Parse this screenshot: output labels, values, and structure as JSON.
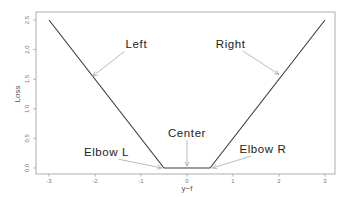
{
  "chart_data": {
    "type": "line",
    "title": "",
    "xlabel": "y−f",
    "ylabel": "Loss",
    "xlim": [
      -3.25,
      3.25
    ],
    "ylim": [
      -0.05,
      2.6
    ],
    "xticks": [
      -3,
      -2,
      -1,
      0,
      1,
      2,
      3
    ],
    "xtick_labels": [
      "-3",
      "-2",
      "-1",
      "0",
      "1",
      "2",
      "3"
    ],
    "yticks": [
      0.0,
      0.5,
      1.0,
      1.5,
      2.0,
      2.5
    ],
    "ytick_labels": [
      "0.0",
      "0.5",
      "1.0",
      "1.5",
      "2.0",
      "2.5"
    ],
    "grid": false,
    "legend": null,
    "series": [
      {
        "name": "epsilon-insensitive loss",
        "x": [
          -3,
          -0.5,
          0.5,
          3
        ],
        "y": [
          2.5,
          0,
          0,
          2.5
        ],
        "color": "#3a3a3a"
      }
    ],
    "annotations": [
      {
        "text": "Left",
        "text_x": -1.1,
        "text_y": 2.02,
        "arrow_to_x": -2.05,
        "arrow_to_y": 1.55
      },
      {
        "text": "Right",
        "text_x": 0.95,
        "text_y": 2.03,
        "arrow_to_x": 2.0,
        "arrow_to_y": 1.58
      },
      {
        "text": "Center",
        "text_x": 0.0,
        "text_y": 0.52,
        "arrow_to_x": 0.0,
        "arrow_to_y": 0.03
      },
      {
        "text": "Elbow L",
        "text_x": -1.75,
        "text_y": 0.2,
        "arrow_to_x": -0.55,
        "arrow_to_y": 0.0
      },
      {
        "text": "Elbow R",
        "text_x": 1.65,
        "text_y": 0.25,
        "arrow_to_x": 0.55,
        "arrow_to_y": 0.0
      }
    ]
  },
  "layout": {
    "frame": {
      "left": 36,
      "top": 12,
      "right": 335,
      "bottom": 174
    },
    "x0_px": 187,
    "x_px_per_unit": 46,
    "y0_px": 168,
    "y_px_per_unit": 59.2
  }
}
